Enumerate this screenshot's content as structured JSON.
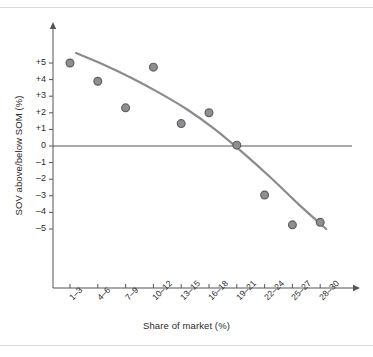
{
  "chart_data": {
    "type": "scatter",
    "title": "",
    "xlabel": "Share of market (%)",
    "ylabel": "SOV above/below SOM (%)",
    "categories": [
      "1–3",
      "4–6",
      "7–9",
      "10–12",
      "13–15",
      "16–18",
      "19–21",
      "22–24",
      "25–27",
      "28–30"
    ],
    "values": [
      5.0,
      3.9,
      2.3,
      4.75,
      1.35,
      2.0,
      0.05,
      -2.95,
      -4.75,
      -4.6
    ],
    "ylim": [
      -5.8,
      5.8
    ],
    "yticks": [
      "+5",
      "+4",
      "+3",
      "+2",
      "+1",
      "0",
      "–1",
      "–2",
      "–3",
      "–4",
      "–5"
    ],
    "ytick_values": [
      5,
      4,
      3,
      2,
      1,
      0,
      -1,
      -2,
      -3,
      -4,
      -5
    ],
    "grid": false,
    "legend": "none",
    "zero_line": 0,
    "series": [
      {
        "name": "SOV vs SOM data points",
        "values": [
          5.0,
          3.9,
          2.3,
          4.75,
          1.35,
          2.0,
          0.05,
          -2.95,
          -4.75,
          -4.6
        ]
      },
      {
        "name": "fitted trend curve",
        "type": "curve",
        "values": [
          5.6,
          4.9,
          4.1,
          3.2,
          2.2,
          1.0,
          -0.4,
          -1.9,
          -3.5,
          -5.0
        ]
      }
    ],
    "colors": {
      "marker_fill": "#8e8e93",
      "marker_stroke": "#5e5e63",
      "trend_line": "#8a8a8f",
      "axis": "#55555a",
      "zero_axis": "#55555a",
      "text": "#2b2b2b",
      "rule": "#d9d9dd"
    }
  }
}
